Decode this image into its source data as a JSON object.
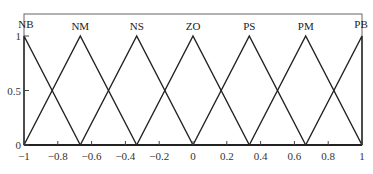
{
  "chart_data": {
    "type": "line",
    "title": "",
    "xlabel": "",
    "ylabel": "",
    "xlim": [
      -1,
      1
    ],
    "ylim": [
      0,
      1
    ],
    "grid": false,
    "x_ticks": [
      "-1",
      "-0.8",
      "-0.6",
      "-0.4",
      "-0.2",
      "0",
      "0.2",
      "0.4",
      "0.6",
      "0.8",
      "1"
    ],
    "y_ticks": [
      "0",
      "0.5",
      "1"
    ],
    "series": [
      {
        "name": "NB",
        "x": [
          -1,
          -1,
          -0.667
        ],
        "values": [
          0,
          1,
          0
        ]
      },
      {
        "name": "NM",
        "x": [
          -1,
          -0.667,
          -0.333
        ],
        "values": [
          0,
          1,
          0
        ]
      },
      {
        "name": "NS",
        "x": [
          -0.667,
          -0.333,
          0
        ],
        "values": [
          0,
          1,
          0
        ]
      },
      {
        "name": "ZO",
        "x": [
          -0.333,
          0,
          0.333
        ],
        "values": [
          0,
          1,
          0
        ]
      },
      {
        "name": "PS",
        "x": [
          0,
          0.333,
          0.667
        ],
        "values": [
          0,
          1,
          0
        ]
      },
      {
        "name": "PM",
        "x": [
          0.333,
          0.667,
          1
        ],
        "values": [
          0,
          1,
          0
        ]
      },
      {
        "name": "PB",
        "x": [
          0.667,
          1,
          1
        ],
        "values": [
          0,
          1,
          0
        ]
      }
    ],
    "annotations": [
      "NB",
      "NM",
      "NS",
      "ZO",
      "PS",
      "PM",
      "PB"
    ]
  }
}
